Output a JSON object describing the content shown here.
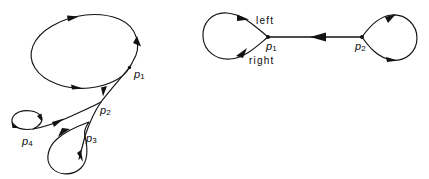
{
  "figure": {
    "title": "",
    "background_color": "#ffffff",
    "stroke_color": "#121212",
    "panels": [
      {
        "id": "left-panel",
        "name": "branched-curve-system",
        "vertex_labels": [
          "p1",
          "p2",
          "p3",
          "p4"
        ]
      },
      {
        "id": "right-panel",
        "name": "two-loop-edge-system",
        "vertex_labels": [
          "p1",
          "p2"
        ],
        "side_labels": [
          "left",
          "right"
        ]
      }
    ]
  },
  "labels": {
    "left_panel": {
      "p1": {
        "base": "p",
        "sub": "1"
      },
      "p2": {
        "base": "p",
        "sub": "2"
      },
      "p3": {
        "base": "p",
        "sub": "3"
      },
      "p4": {
        "base": "p",
        "sub": "4"
      }
    },
    "right_panel": {
      "p1": {
        "base": "p",
        "sub": "1"
      },
      "p2": {
        "base": "p",
        "sub": "2"
      },
      "left": "left",
      "right": "right"
    }
  }
}
